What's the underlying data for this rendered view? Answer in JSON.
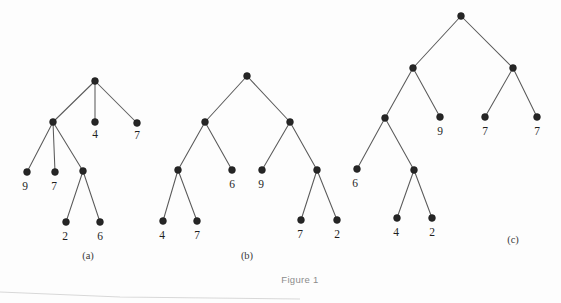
{
  "figure": {
    "caption": "Figure 1",
    "background_color": "#fdfdfd",
    "node_color": "#262626",
    "edge_color": "#5a5a5a",
    "label_color": "#1f1f1f",
    "caption_color": "#8c8c8c"
  },
  "trees": [
    {
      "id": "tree-a",
      "sublabel": "(a)",
      "sublabel_pos": {
        "x": 88,
        "y": 259
      },
      "nodes": [
        {
          "id": "a-root",
          "x": 95,
          "y": 81,
          "label": "",
          "kind": "internal"
        },
        {
          "id": "a-n1",
          "x": 53,
          "y": 122,
          "label": "",
          "kind": "internal"
        },
        {
          "id": "a-l4",
          "x": 95,
          "y": 122,
          "label": "4",
          "kind": "leaf",
          "label_x": 95,
          "label_y": 138
        },
        {
          "id": "a-l7",
          "x": 137,
          "y": 123,
          "label": "7",
          "kind": "leaf",
          "label_x": 137,
          "label_y": 139
        },
        {
          "id": "a-l9",
          "x": 27,
          "y": 172,
          "label": "9",
          "kind": "leaf",
          "label_x": 25,
          "label_y": 190
        },
        {
          "id": "a-l7b",
          "x": 55,
          "y": 172,
          "label": "7",
          "kind": "leaf",
          "label_x": 54,
          "label_y": 190
        },
        {
          "id": "a-n2",
          "x": 83,
          "y": 171,
          "label": "",
          "kind": "internal"
        },
        {
          "id": "a-l2",
          "x": 66,
          "y": 222,
          "label": "2",
          "kind": "leaf",
          "label_x": 65,
          "label_y": 240
        },
        {
          "id": "a-l6",
          "x": 100,
          "y": 222,
          "label": "6",
          "kind": "leaf",
          "label_x": 100,
          "label_y": 240
        }
      ],
      "edges": [
        [
          "a-root",
          "a-n1"
        ],
        [
          "a-root",
          "a-l4"
        ],
        [
          "a-root",
          "a-l7"
        ],
        [
          "a-n1",
          "a-l9"
        ],
        [
          "a-n1",
          "a-l7b"
        ],
        [
          "a-n1",
          "a-n2"
        ],
        [
          "a-n2",
          "a-l2"
        ],
        [
          "a-n2",
          "a-l6"
        ]
      ]
    },
    {
      "id": "tree-b",
      "sublabel": "(b)",
      "sublabel_pos": {
        "x": 247,
        "y": 259
      },
      "nodes": [
        {
          "id": "b-root",
          "x": 247,
          "y": 76,
          "label": "",
          "kind": "internal"
        },
        {
          "id": "b-n1",
          "x": 205,
          "y": 122,
          "label": "",
          "kind": "internal"
        },
        {
          "id": "b-n2",
          "x": 290,
          "y": 122,
          "label": "",
          "kind": "internal"
        },
        {
          "id": "b-n3",
          "x": 178,
          "y": 170,
          "label": "",
          "kind": "internal"
        },
        {
          "id": "b-l6",
          "x": 232,
          "y": 170,
          "label": "6",
          "kind": "leaf",
          "label_x": 232,
          "label_y": 188
        },
        {
          "id": "b-l9",
          "x": 262,
          "y": 170,
          "label": "9",
          "kind": "leaf",
          "label_x": 261,
          "label_y": 188
        },
        {
          "id": "b-n4",
          "x": 317,
          "y": 170,
          "label": "",
          "kind": "internal"
        },
        {
          "id": "b-l4",
          "x": 163,
          "y": 221,
          "label": "4",
          "kind": "leaf",
          "label_x": 162,
          "label_y": 239
        },
        {
          "id": "b-l7",
          "x": 197,
          "y": 221,
          "label": "7",
          "kind": "leaf",
          "label_x": 197,
          "label_y": 239
        },
        {
          "id": "b-l7b",
          "x": 301,
          "y": 220,
          "label": "7",
          "kind": "leaf",
          "label_x": 300,
          "label_y": 238
        },
        {
          "id": "b-l2",
          "x": 337,
          "y": 220,
          "label": "2",
          "kind": "leaf",
          "label_x": 337,
          "label_y": 238
        }
      ],
      "edges": [
        [
          "b-root",
          "b-n1"
        ],
        [
          "b-root",
          "b-n2"
        ],
        [
          "b-n1",
          "b-n3"
        ],
        [
          "b-n1",
          "b-l6"
        ],
        [
          "b-n2",
          "b-l9"
        ],
        [
          "b-n2",
          "b-n4"
        ],
        [
          "b-n3",
          "b-l4"
        ],
        [
          "b-n3",
          "b-l7"
        ],
        [
          "b-n4",
          "b-l7b"
        ],
        [
          "b-n4",
          "b-l2"
        ]
      ]
    },
    {
      "id": "tree-c",
      "sublabel": "(c)",
      "sublabel_pos": {
        "x": 513,
        "y": 243
      },
      "nodes": [
        {
          "id": "c-root",
          "x": 461,
          "y": 16,
          "label": "",
          "kind": "internal"
        },
        {
          "id": "c-n1",
          "x": 413,
          "y": 68,
          "label": "",
          "kind": "internal"
        },
        {
          "id": "c-n2",
          "x": 513,
          "y": 68,
          "label": "",
          "kind": "internal"
        },
        {
          "id": "c-n3",
          "x": 385,
          "y": 118,
          "label": "",
          "kind": "internal"
        },
        {
          "id": "c-l9",
          "x": 440,
          "y": 117,
          "label": "9",
          "kind": "leaf",
          "label_x": 440,
          "label_y": 135
        },
        {
          "id": "c-l7",
          "x": 485,
          "y": 117,
          "label": "7",
          "kind": "leaf",
          "label_x": 485,
          "label_y": 135
        },
        {
          "id": "c-l7b",
          "x": 537,
          "y": 117,
          "label": "7",
          "kind": "leaf",
          "label_x": 537,
          "label_y": 135
        },
        {
          "id": "c-l6",
          "x": 357,
          "y": 169,
          "label": "6",
          "kind": "leaf",
          "label_x": 355,
          "label_y": 187
        },
        {
          "id": "c-n4",
          "x": 414,
          "y": 170,
          "label": "",
          "kind": "internal"
        },
        {
          "id": "c-l4",
          "x": 397,
          "y": 218,
          "label": "4",
          "kind": "leaf",
          "label_x": 396,
          "label_y": 236
        },
        {
          "id": "c-l2",
          "x": 432,
          "y": 218,
          "label": "2",
          "kind": "leaf",
          "label_x": 432,
          "label_y": 236
        }
      ],
      "edges": [
        [
          "c-root",
          "c-n1"
        ],
        [
          "c-root",
          "c-n2"
        ],
        [
          "c-n1",
          "c-n3"
        ],
        [
          "c-n1",
          "c-l9"
        ],
        [
          "c-n2",
          "c-l7"
        ],
        [
          "c-n2",
          "c-l7b"
        ],
        [
          "c-n3",
          "c-l6"
        ],
        [
          "c-n3",
          "c-n4"
        ],
        [
          "c-n4",
          "c-l4"
        ],
        [
          "c-n4",
          "c-l2"
        ]
      ]
    }
  ],
  "caption_pos": {
    "x": 300,
    "y": 283
  },
  "node_radius": 3.4
}
